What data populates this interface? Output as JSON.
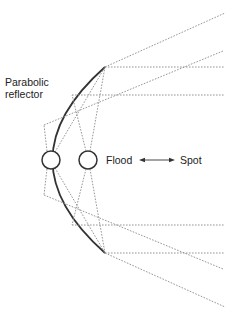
{
  "labels": {
    "reflector_line1": "Parabolic",
    "reflector_line2": "reflector",
    "flood": "Flood",
    "spot": "Spot"
  },
  "colors": {
    "reflector": "#333333",
    "rays": "#8a8a8a",
    "text": "#222222"
  },
  "elements": {
    "sources": [
      {
        "name": "flood-position-source",
        "cx": 51,
        "cy": 160,
        "r": 9
      },
      {
        "name": "spot-position-source",
        "cx": 88,
        "cy": 160,
        "r": 9
      }
    ],
    "arrow": {
      "from": "Flood",
      "to": "Spot",
      "bidirectional": true
    }
  }
}
